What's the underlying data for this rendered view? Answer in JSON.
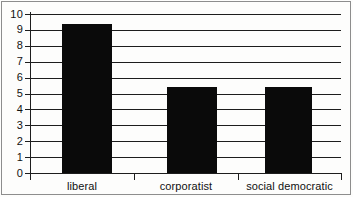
{
  "chart_data": {
    "type": "bar",
    "title": "",
    "subtitle": "",
    "xlabel": "",
    "ylabel": "",
    "categories": [
      "liberal",
      "corporatist",
      "social democratic"
    ],
    "values": [
      9.4,
      5.4,
      5.4
    ],
    "series": [
      {
        "name": "",
        "values": [
          9.4,
          5.4,
          5.4
        ]
      }
    ],
    "ylim": [
      0,
      10
    ],
    "y_ticks": [
      0,
      1,
      2,
      3,
      4,
      5,
      6,
      7,
      8,
      9,
      10
    ],
    "y_tick_labels": [
      "0",
      "1",
      "2",
      "3",
      "4",
      "5",
      "6",
      "7",
      "8",
      "9",
      "10"
    ],
    "grid": true,
    "grid_axis": "y",
    "legend": false,
    "legend_position": "none",
    "bar_color": "#0a0a0a",
    "axis_color": "#1d1d1d",
    "background_color": "#fdfdfc",
    "frame_color": "#8d8d8d",
    "annotations": []
  }
}
